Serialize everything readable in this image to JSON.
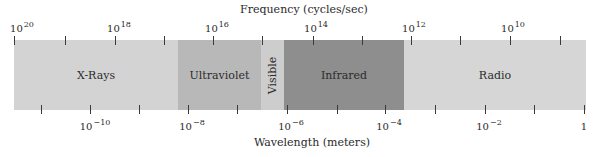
{
  "diagram": {
    "title_top": "Frequency (cycles/sec)",
    "title_bottom": "Wavelength (meters)",
    "frequency_axis": {
      "labels": [
        {
          "base": "10",
          "exp": "20",
          "x": 22
        },
        {
          "base": "10",
          "exp": "18",
          "x": 119
        },
        {
          "base": "10",
          "exp": "16",
          "x": 217
        },
        {
          "base": "10",
          "exp": "14",
          "x": 316
        },
        {
          "base": "10",
          "exp": "12",
          "x": 414
        },
        {
          "base": "10",
          "exp": "10",
          "x": 513
        }
      ],
      "tick_x": [
        14,
        65,
        115,
        164,
        213,
        262,
        313,
        362,
        411,
        460,
        510,
        560
      ]
    },
    "wavelength_axis": {
      "labels": [
        {
          "base": "10",
          "exp": "−10",
          "x": 95
        },
        {
          "base": "10",
          "exp": "−8",
          "x": 192
        },
        {
          "base": "10",
          "exp": "−6",
          "x": 291
        },
        {
          "base": "10",
          "exp": "−4",
          "x": 389
        },
        {
          "base": "10",
          "exp": "−2",
          "x": 489
        },
        {
          "base": "1",
          "exp": "",
          "x": 584
        }
      ],
      "tick_x": [
        41,
        90,
        139,
        188,
        237,
        287,
        337,
        385,
        435,
        485,
        534,
        584
      ]
    },
    "bands": [
      {
        "name": "X-Rays",
        "start": 0,
        "end": 164,
        "color": "#d3d3d3",
        "vertical": false
      },
      {
        "name": "Ultraviolet",
        "start": 164,
        "end": 247,
        "color": "#b8b8b8",
        "vertical": false
      },
      {
        "name": "Visible",
        "start": 247,
        "end": 270,
        "color": "#cdcdcd",
        "vertical": true
      },
      {
        "name": "Infrared",
        "start": 270,
        "end": 390,
        "color": "#8e8e8e",
        "vertical": false
      },
      {
        "name": "Radio",
        "start": 390,
        "end": 572,
        "color": "#d6d6d6",
        "vertical": false
      }
    ]
  }
}
